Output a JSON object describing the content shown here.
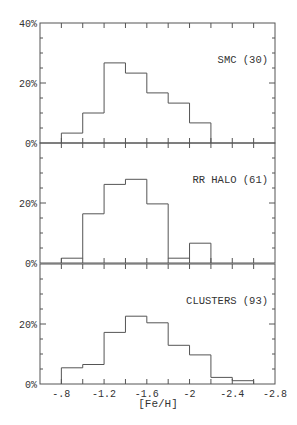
{
  "chart_data": {
    "type": "bar",
    "subtype": "stacked-panel step histogram",
    "xlabel": "[Fe/H]",
    "ylabel": "",
    "x_axis": {
      "range": [
        -0.6,
        -2.8
      ],
      "ticks": [
        -0.8,
        -1.2,
        -1.6,
        -2.0,
        -2.4,
        -2.8
      ],
      "tick_labels": [
        "-.8",
        "-1.2",
        "-1.6",
        "-2",
        "-2.4",
        "-2.8"
      ],
      "minor_step": 0.2
    },
    "y_axis": {
      "range": [
        0,
        40
      ],
      "tick_labels_top_panel": [
        "0%",
        "20%",
        "40%"
      ],
      "tick_labels_other_panels": [
        "0%",
        "20%"
      ],
      "minor_step": 5
    },
    "grid": false,
    "bin_edges": [
      -0.8,
      -1.0,
      -1.2,
      -1.4,
      -1.6,
      -1.8,
      -2.0,
      -2.2,
      -2.4,
      -2.6
    ],
    "panels": [
      {
        "label": "SMC (30)",
        "name": "SMC",
        "n": 30,
        "values": [
          3.3,
          10.0,
          26.7,
          23.3,
          16.7,
          13.3,
          6.7,
          0,
          0
        ]
      },
      {
        "label": "RR HALO (61)",
        "name": "RR HALO",
        "n": 61,
        "values": [
          1.6,
          16.4,
          26.2,
          27.9,
          19.7,
          1.6,
          6.6,
          0,
          0
        ]
      },
      {
        "label": "CLUSTERS (93)",
        "name": "CLUSTERS",
        "n": 93,
        "values": [
          5.4,
          6.5,
          17.2,
          22.6,
          20.4,
          12.9,
          9.7,
          2.2,
          1.1
        ]
      }
    ]
  },
  "colors": {
    "line": "#555555",
    "text": "#333333",
    "background": "#ffffff"
  }
}
